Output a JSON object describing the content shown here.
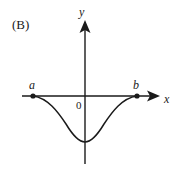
{
  "figure": {
    "panel_label": "(B)",
    "axes": {
      "x_label": "x",
      "y_label": "y",
      "origin_label": "0"
    },
    "points": [
      {
        "name": "a",
        "label": "a"
      },
      {
        "name": "b",
        "label": "b"
      }
    ],
    "curve": {
      "description": "Smooth bell-shaped dip below the x-axis starting at a, reaching a minimum on the y-axis, and returning to b",
      "shape": "inverted-bell"
    },
    "colors": {
      "ink": "#1a1a1a",
      "background": "#ffffff"
    }
  }
}
